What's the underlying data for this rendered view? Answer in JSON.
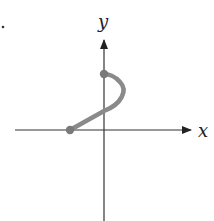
{
  "diagram": {
    "type": "curve-on-cartesian-axes",
    "axes": {
      "x_label": "x",
      "y_label": "y"
    },
    "curve": {
      "description": "Line segment from a point on the negative x-axis rising to the positive y-axis, then a semicircular arc bulging right ending at a higher point on the y-axis",
      "start_point": "left endpoint on x-axis (closed dot)",
      "end_point": "upper endpoint on y-axis (closed dot)",
      "color": "#8a8a8a"
    },
    "colors": {
      "axis": "#333333",
      "curve": "#8a8a8a",
      "background": "#ffffff"
    }
  }
}
